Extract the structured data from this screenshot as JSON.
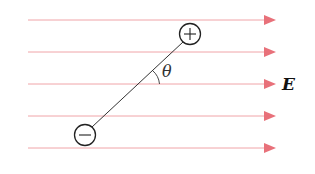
{
  "diagram": {
    "field": {
      "label": "E",
      "direction": "right",
      "line_count": 5,
      "line_y": [
        20,
        52,
        84,
        116,
        148
      ],
      "color_line": "#f0a4a8",
      "color_arrow": "#e8717a"
    },
    "dipole": {
      "positive_charge": {
        "symbol": "+",
        "label": "positive-charge"
      },
      "negative_charge": {
        "symbol": "−",
        "label": "negative-charge"
      }
    },
    "angle": {
      "label": "θ"
    }
  }
}
